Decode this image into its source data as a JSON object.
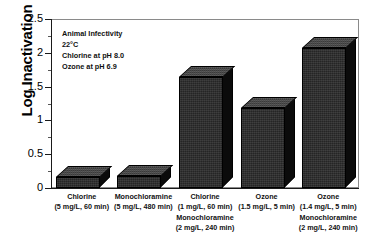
{
  "chart_data": {
    "type": "bar",
    "title": "",
    "xlabel": "",
    "ylabel": "Log Inactivation",
    "ylim": [
      0,
      2.5
    ],
    "yticks": [
      "0",
      "0.5",
      "1",
      "1.5",
      "2",
      "2.5"
    ],
    "grid": false,
    "legend": "none",
    "bar_style": "3d-block",
    "bar_color": "#252525",
    "categories": [
      "Chlorine\n(5 mg/L, 60 min)",
      "Monochloramine\n(5 mg/L, 480 min)",
      "Chlorine\n(1 mg/L, 60 min)\nMonochloramine\n(2 mg/L, 240 min)",
      "Ozone\n(1.5 mg/L, 5 min)",
      "Ozone\n(1.4 mg/L, 5 min)\nMonochloramine\n(2 mg/L, 240 min)"
    ],
    "values": [
      0.16,
      0.18,
      1.64,
      1.19,
      2.07
    ],
    "annotation_lines": [
      "Animal Infectivity",
      "22°C",
      "Chlorine at pH 8.0",
      "Ozone at pH 6.9"
    ]
  },
  "axis": {
    "y_title": "Log Inactivation",
    "y_ticks": [
      {
        "label": "2.5",
        "value": 2.5
      },
      {
        "label": "2",
        "value": 2.0
      },
      {
        "label": "1.5",
        "value": 1.5
      },
      {
        "label": "1",
        "value": 1.0
      },
      {
        "label": "0.5",
        "value": 0.5
      },
      {
        "label": "0",
        "value": 0.0
      }
    ]
  },
  "bars": [
    {
      "value": 0.16,
      "label_lines": [
        "Chlorine",
        "(5 mg/L, 60 min)"
      ]
    },
    {
      "value": 0.18,
      "label_lines": [
        "Monochloramine",
        "(5 mg/L, 480 min)"
      ]
    },
    {
      "value": 1.64,
      "label_lines": [
        "Chlorine",
        "(1 mg/L, 60 min)",
        "Monochloramine",
        "(2 mg/L, 240 min)"
      ]
    },
    {
      "value": 1.19,
      "label_lines": [
        "Ozone",
        "(1.5 mg/L, 5 min)"
      ]
    },
    {
      "value": 2.07,
      "label_lines": [
        "Ozone",
        "(1.4 mg/L, 5 min)",
        "Monochloramine",
        "(2 mg/L, 240 min)"
      ]
    }
  ],
  "annotation": {
    "line1": "Animal Infectivity",
    "line2": "22°C",
    "line3": "Chlorine at pH 8.0",
    "line4": "Ozone at pH 6.9"
  }
}
